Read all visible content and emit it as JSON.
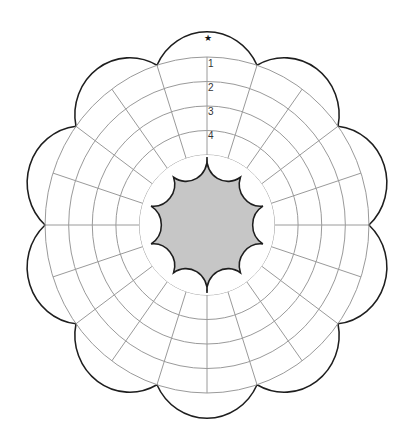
{
  "diagram": {
    "type": "flower-wheel rating chart",
    "petal_count": 10,
    "spoke_count": 20,
    "ring_count": 5,
    "ring_labels": [
      "1",
      "2",
      "3",
      "4"
    ],
    "top_marker": "★",
    "center_fill": "#c6c6c6",
    "outline_color": "#1e1e1e",
    "grid_color": "#9a9a9a"
  }
}
